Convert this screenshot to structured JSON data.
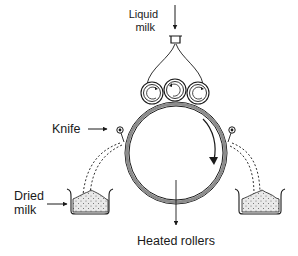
{
  "labels": {
    "liquid_milk_line1": "Liquid",
    "liquid_milk_line2": "milk",
    "knife": "Knife",
    "dried_milk_line1": "Dried",
    "dried_milk_line2": "milk",
    "heated_rollers": "Heated rollers"
  },
  "components": {
    "feed_rollers_count": 3,
    "main_drum_rotation": "clockwise",
    "knives_count": 2,
    "collection_trays_count": 2
  },
  "colors": {
    "line": "#1a1a1a",
    "drum_fill": "#8c8c8c",
    "powder_fill": "#e6e6e6"
  }
}
